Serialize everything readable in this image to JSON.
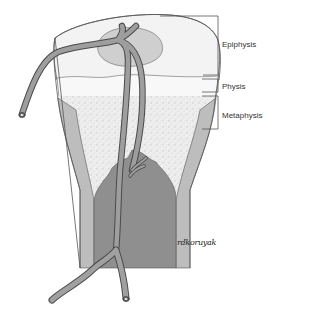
{
  "diagram": {
    "labels": {
      "epiphysis": "Epiphysis",
      "physis": "Physis",
      "metaphysis": "Metaphysis"
    },
    "signature": "rdkoruyak",
    "colors": {
      "outline": "#555555",
      "epiphysis_fill": "#f2f2f2",
      "ossification_center": "#cfcfcf",
      "physis_fill": "#f7f7f7",
      "metaphysis_stipple": "#e3e3e3",
      "cortex": "#b5b5b5",
      "medullary_cavity": "#8e8e8e",
      "vessel": "#9a9a9a",
      "vessel_edge": "#4a4a4a"
    },
    "structures": [
      "epiphysis",
      "secondary-ossification-center",
      "physis",
      "metaphysis",
      "cortex",
      "medullary-cavity",
      "epiphyseal-artery",
      "nutrient-artery",
      "metaphyseal-vessels"
    ]
  }
}
